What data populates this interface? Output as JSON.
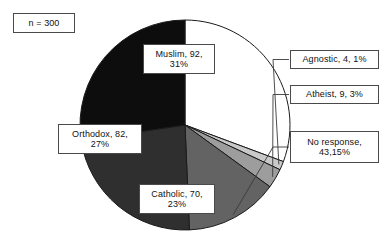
{
  "chart_data": {
    "type": "pie",
    "title": "",
    "sample_size_label": "n = 300",
    "total": 300,
    "legend_position": "callout-labels",
    "categories": [
      "Muslim",
      "Agnostic",
      "Atheist",
      "No response",
      "Catholic",
      "Orthodox"
    ],
    "values": [
      92,
      4,
      9,
      43,
      70,
      82
    ],
    "percents": [
      31,
      1,
      3,
      15,
      23,
      27
    ],
    "slices": [
      {
        "name": "Muslim",
        "value": 92,
        "percent": 31,
        "label": "Muslim, 92,\n31%",
        "color": "#ffffff",
        "start_angle": 0,
        "sweep_angle": 110.4,
        "label_placement": "inside"
      },
      {
        "name": "Agnostic",
        "value": 4,
        "percent": 1,
        "label": "Agnostic, 4, 1%",
        "color": "#c9c9c9",
        "start_angle": 110.4,
        "sweep_angle": 4.8,
        "label_placement": "callout"
      },
      {
        "name": "Atheist",
        "value": 9,
        "percent": 3,
        "label": "Atheist, 9, 3%",
        "color": "#9d9d9d",
        "start_angle": 115.2,
        "sweep_angle": 10.8,
        "label_placement": "callout"
      },
      {
        "name": "No response",
        "value": 43,
        "percent": 15,
        "label": "No response,\n43,15%",
        "color": "#636363",
        "start_angle": 126.0,
        "sweep_angle": 51.6,
        "label_placement": "callout"
      },
      {
        "name": "Catholic",
        "value": 70,
        "percent": 23,
        "label": "Catholic, 70,\n23%",
        "color": "#2f2f2f",
        "start_angle": 177.6,
        "sweep_angle": 84.0,
        "label_placement": "inside"
      },
      {
        "name": "Orthodox",
        "value": 82,
        "percent": 27,
        "label": "Orthodox, 82,\n27%",
        "color": "#0d0d0d",
        "start_angle": 261.6,
        "sweep_angle": 98.4,
        "label_placement": "inside"
      }
    ],
    "geometry": {
      "center_x": 185,
      "center_y": 125,
      "radius": 105
    },
    "outline_color": "#1a1a1a",
    "caption_partial": ""
  }
}
